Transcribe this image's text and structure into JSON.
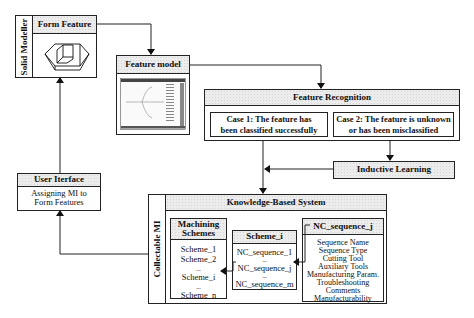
{
  "solid_modeller": {
    "label": "Solid Modeller",
    "form_feature": {
      "title": "Form Feature",
      "icon": "cube-with-pocket-icon"
    }
  },
  "feature_model": {
    "title": "Feature model",
    "thumbnail": "feature-tree-screenshot"
  },
  "feature_recognition": {
    "title": "Feature Recognition",
    "case1": {
      "line1": "Case 1: The feature has",
      "line2": "been classified successfully"
    },
    "case2": {
      "line1": "Case 2: The feature is unknown",
      "line2": "or has been misclassified"
    }
  },
  "inductive_learning": {
    "title": "Inductive Learning"
  },
  "user_interface": {
    "title": "User Iterface",
    "line1": "Assigning MI to",
    "line2": "Form Features"
  },
  "collectable_mi": {
    "label": "Collectable MI",
    "kbs_title": "Knowledge-Based System",
    "machining_schemes": {
      "title_line1": "Machining",
      "title_line2": "Schemes",
      "items": [
        "Scheme_1",
        "Scheme_2",
        "...",
        "Scheme_i",
        "...",
        "Scheme_n"
      ]
    },
    "scheme_i": {
      "title": "Scheme_i",
      "items": [
        "NC_sequence_1",
        "...",
        "NC_sequence_j",
        "...",
        "NC_sequence_m"
      ]
    },
    "nc_sequence_j": {
      "title": "NC_sequence_j",
      "items": [
        "Sequence Name",
        "Sequence Type",
        "Cutting Tool",
        "Auxiliary Tools",
        "Manufacturing Param.",
        "Troubleshooting",
        "Comments",
        "Manufacturability"
      ]
    }
  }
}
